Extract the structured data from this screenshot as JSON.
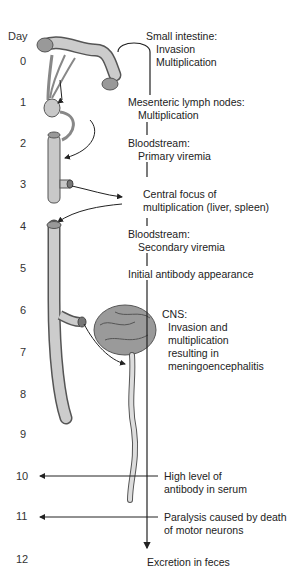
{
  "timeline": {
    "axis_label": "Day",
    "days": [
      "0",
      "1",
      "2",
      "3",
      "4",
      "5",
      "6",
      "7",
      "8",
      "9",
      "10",
      "11",
      "12"
    ]
  },
  "stages": [
    {
      "title": "Small intestine:",
      "lines": [
        "Invasion",
        "Multiplication"
      ]
    },
    {
      "title": "Mesenteric lymph nodes:",
      "lines": [
        "Multiplication"
      ]
    },
    {
      "title": "Bloodstream:",
      "lines": [
        "Primary viremia"
      ]
    },
    {
      "title": "Central focus of",
      "lines": [
        "multiplication (liver, spleen)"
      ]
    },
    {
      "title": "Bloodstream:",
      "lines": [
        "Secondary viremia"
      ]
    },
    {
      "title": "Initial antibody appearance",
      "lines": []
    },
    {
      "title": "CNS:",
      "lines": [
        "Invasion and",
        "multiplication",
        "resulting in",
        "meningoencephalitis"
      ]
    },
    {
      "title": "High level of",
      "lines": [
        "antibody in serum"
      ]
    },
    {
      "title": "Paralysis caused by death",
      "lines": [
        "of motor neurons"
      ]
    },
    {
      "title": "Excretion in feces",
      "lines": []
    }
  ],
  "colors": {
    "organ_fill": "#c8c8c8",
    "organ_stroke": "#555555",
    "line": "#222222",
    "brain": "#9a9a9a"
  }
}
